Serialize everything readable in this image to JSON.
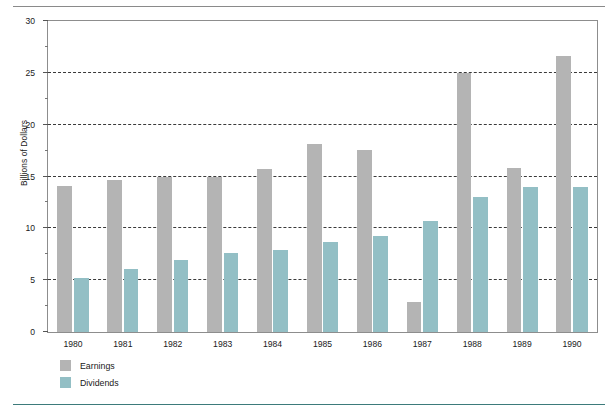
{
  "chart_data": {
    "type": "bar",
    "title": "",
    "subtitle": "",
    "xlabel": "",
    "ylabel": "Billions of Dollars",
    "categories": [
      "1980",
      "1981",
      "1982",
      "1983",
      "1984",
      "1985",
      "1986",
      "1987",
      "1988",
      "1989",
      "1990"
    ],
    "series": [
      {
        "name": "Earnings",
        "color": "#b4b4b4",
        "values": [
          14.1,
          14.7,
          15.0,
          15.0,
          15.7,
          18.1,
          17.6,
          2.9,
          25.0,
          15.8,
          26.6
        ]
      },
      {
        "name": "Dividends",
        "color": "#93bfc5",
        "values": [
          5.2,
          6.1,
          6.9,
          7.6,
          7.9,
          8.7,
          9.3,
          10.7,
          13.0,
          14.0,
          14.0
        ]
      }
    ],
    "ylim": [
      0,
      30
    ],
    "ytick_labels": [
      "0",
      "5",
      "10",
      "15",
      "20",
      "25",
      "30"
    ],
    "ytick_values": [
      0,
      5,
      10,
      15,
      20,
      25,
      30
    ],
    "yminor_values": [
      2.5,
      7.5,
      12.5,
      17.5,
      22.5,
      27.5
    ],
    "grid": "horizontal-dashed",
    "legend_position": "below-left"
  },
  "legend": {
    "items": [
      {
        "label": "Earnings",
        "swatch": "earnings"
      },
      {
        "label": "Dividends",
        "swatch": "dividends"
      }
    ]
  },
  "rules": {
    "top_color": "#8a8a8a",
    "bottom_color": "#3d7b7b"
  }
}
